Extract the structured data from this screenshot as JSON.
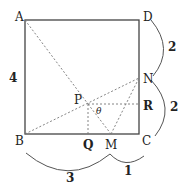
{
  "diagram": {
    "type": "geometry",
    "shape": "square",
    "points": {
      "A": {
        "label": "A",
        "x": 25,
        "y": 20
      },
      "D": {
        "label": "D",
        "x": 139,
        "y": 20
      },
      "B": {
        "label": "B",
        "x": 25,
        "y": 134
      },
      "C": {
        "label": "C",
        "x": 139,
        "y": 134
      },
      "N": {
        "label": "N",
        "x": 139,
        "y": 78
      },
      "P": {
        "label": "P",
        "x": 88,
        "y": 104
      },
      "Q": {
        "label": "Q",
        "x": 88,
        "y": 134
      },
      "M": {
        "label": "M",
        "x": 111,
        "y": 134
      },
      "R": {
        "label": "R",
        "x": 139,
        "y": 104
      }
    },
    "angle_label": "θ",
    "measurements": {
      "side_AB": "4",
      "DN": "2",
      "NC": "2",
      "BM": "3",
      "MC": "1"
    },
    "colors": {
      "line": "#444444",
      "dashed": "#777777",
      "text": "#222222"
    }
  }
}
